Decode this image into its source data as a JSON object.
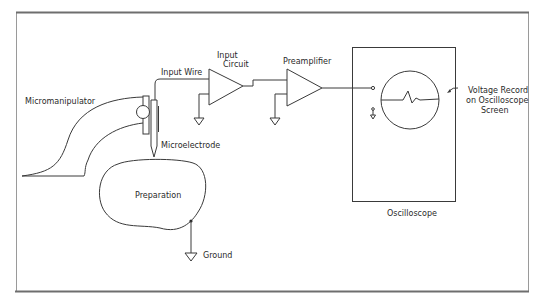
{
  "diagram": {
    "labels": {
      "micromanipulator": "Micromanipulator",
      "input_wire": "Input Wire",
      "input_circuit_line1": "Input",
      "input_circuit_line2": "Circuit",
      "preamplifier": "Preamplifier",
      "microelectrode": "Microelectrode",
      "preparation": "Preparation",
      "ground": "Ground",
      "oscilloscope": "Oscilloscope",
      "voltage_record_line1": "Voltage Record",
      "voltage_record_line2": "on Oscilloscope",
      "voltage_record_line3": "Screen"
    },
    "components": [
      {
        "id": "micromanipulator",
        "type": "mechanical-arm"
      },
      {
        "id": "microelectrode",
        "type": "electrode"
      },
      {
        "id": "input-wire",
        "type": "wire"
      },
      {
        "id": "input-circuit",
        "type": "amplifier-triangle"
      },
      {
        "id": "preamplifier",
        "type": "amplifier-triangle"
      },
      {
        "id": "oscilloscope",
        "type": "display-box"
      },
      {
        "id": "preparation",
        "type": "tissue-blob"
      },
      {
        "id": "ground",
        "type": "ground-symbol"
      }
    ],
    "connections": [
      {
        "from": "microelectrode",
        "to": "input-circuit",
        "via": "input-wire"
      },
      {
        "from": "input-circuit",
        "to": "preamplifier"
      },
      {
        "from": "preamplifier",
        "to": "oscilloscope"
      },
      {
        "from": "preparation",
        "to": "ground"
      }
    ],
    "colors": {
      "line": "#3a3a3a",
      "frame_thick": "#6e6e6e",
      "frame_thin": "#9a9a9a",
      "background": "#ffffff"
    }
  }
}
